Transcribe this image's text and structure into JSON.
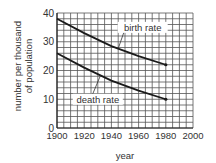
{
  "chart_data": {
    "type": "line",
    "title": "",
    "xlabel": "year",
    "ylabel": "number per thousand of population",
    "ylabel_lines": [
      "number per thousand",
      "of population"
    ],
    "xlim": [
      1900,
      2000
    ],
    "ylim": [
      0,
      40
    ],
    "xticks": [
      1900,
      1920,
      1940,
      1960,
      1980,
      2000
    ],
    "yticks": [
      0,
      10,
      20,
      30,
      40
    ],
    "grid": true,
    "grid_minor_x_step": 5,
    "grid_minor_y_step": 2,
    "x": [
      1900,
      1920,
      1940,
      1960,
      1980
    ],
    "series": [
      {
        "name": "birth rate",
        "values": [
          38,
          33,
          28.5,
          25,
          22
        ]
      },
      {
        "name": "death rate",
        "values": [
          26,
          21,
          16.5,
          13,
          10
        ]
      }
    ],
    "annotations": [
      {
        "text": "birth rate",
        "points_to_x": 1945,
        "label_x": 1963,
        "label_y": 35
      },
      {
        "text": "death rate",
        "points_to_x": 1932,
        "label_x": 1930,
        "label_y": 10
      }
    ],
    "colors": {
      "line": "#1a1a1a",
      "grid": "#555555",
      "text": "#333333"
    }
  }
}
